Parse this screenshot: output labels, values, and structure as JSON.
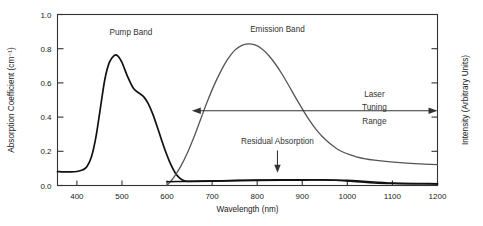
{
  "chart_data": {
    "type": "line",
    "title": "",
    "xlabel": "Wavelength (nm)",
    "ylabel": "Absorption Coefficient (cm⁻¹)",
    "y2label": "Intensity (Arbitrary Units)",
    "xlim": [
      357,
      1200
    ],
    "ylim": [
      0.0,
      1.0
    ],
    "grid": false,
    "legend_position": "inline-annotations",
    "xticks": [
      400,
      500,
      600,
      700,
      800,
      900,
      1000,
      1100,
      1200
    ],
    "xticklabels": [
      "400",
      "500",
      "600",
      "700",
      "800",
      "900",
      "1000",
      "1100",
      "1200"
    ],
    "yticks": [
      0.0,
      0.2,
      0.4,
      0.6,
      0.8,
      1.0
    ],
    "yticklabels": [
      "0.0",
      "0.2",
      "0.4",
      "0.6",
      "0.8",
      "1.0"
    ],
    "y2ticks": [
      0.2,
      0.4,
      0.6,
      0.8
    ],
    "y2ticklabels": [
      "",
      "",
      "",
      ""
    ],
    "series": [
      {
        "name": "Pump Band",
        "color": "#111111",
        "x": [
          357,
          370,
          385,
          400,
          412,
          422,
          432,
          442,
          452,
          462,
          472,
          482,
          490,
          500,
          512,
          525,
          538,
          548,
          558,
          568,
          578,
          588,
          598,
          608,
          618,
          628,
          638,
          648,
          660,
          700,
          800,
          900,
          1000,
          1100,
          1200
        ],
        "values": [
          0.082,
          0.08,
          0.08,
          0.082,
          0.09,
          0.11,
          0.165,
          0.28,
          0.45,
          0.62,
          0.72,
          0.758,
          0.76,
          0.72,
          0.64,
          0.57,
          0.54,
          0.52,
          0.48,
          0.42,
          0.345,
          0.265,
          0.19,
          0.125,
          0.075,
          0.043,
          0.028,
          0.024,
          0.024,
          0.026,
          0.03,
          0.032,
          0.03,
          0.014,
          0.01
        ]
      },
      {
        "name": "Emission Band",
        "color": "#555555",
        "x": [
          600,
          615,
          630,
          645,
          660,
          675,
          690,
          705,
          720,
          735,
          750,
          765,
          780,
          795,
          810,
          825,
          840,
          855,
          870,
          885,
          900,
          915,
          930,
          945,
          960,
          975,
          990,
          1005,
          1020,
          1040,
          1060,
          1080,
          1110,
          1150,
          1200
        ],
        "values": [
          0.0,
          0.048,
          0.11,
          0.19,
          0.285,
          0.39,
          0.495,
          0.59,
          0.672,
          0.74,
          0.79,
          0.818,
          0.828,
          0.822,
          0.8,
          0.762,
          0.712,
          0.652,
          0.585,
          0.515,
          0.448,
          0.385,
          0.33,
          0.285,
          0.248,
          0.218,
          0.196,
          0.18,
          0.168,
          0.156,
          0.148,
          0.142,
          0.135,
          0.128,
          0.122
        ]
      },
      {
        "name": "Residual Absorption",
        "color": "#111111",
        "x": [
          600,
          640,
          680,
          720,
          760,
          800,
          840,
          880,
          920,
          950,
          975,
          1000,
          1030,
          1060,
          1100,
          1150,
          1200
        ],
        "values": [
          0.022,
          0.024,
          0.026,
          0.028,
          0.03,
          0.032,
          0.033,
          0.034,
          0.034,
          0.033,
          0.03,
          0.026,
          0.02,
          0.015,
          0.012,
          0.01,
          0.009
        ]
      }
    ],
    "annotations": [
      {
        "name": "pump-band-label",
        "text": "Pump Band",
        "x": 520,
        "y": 0.88,
        "anchor": "middle"
      },
      {
        "name": "emission-band-label",
        "text": "Emission Band",
        "x": 845,
        "y": 0.895,
        "anchor": "middle"
      },
      {
        "name": "residual-absorption-label",
        "text": "Residual Absorption",
        "x": 845,
        "y": 0.24,
        "anchor": "middle"
      },
      {
        "name": "laser-tuning-range-line1",
        "text": "Laser",
        "x": 1060,
        "y": 0.52,
        "anchor": "middle"
      },
      {
        "name": "laser-tuning-range-line2",
        "text": "Tuning",
        "x": 1060,
        "y": 0.44,
        "anchor": "middle"
      },
      {
        "name": "laser-tuning-range-line3",
        "text": "Range",
        "x": 1060,
        "y": 0.36,
        "anchor": "middle"
      }
    ],
    "arrows": [
      {
        "name": "laser-tuning-range-arrow",
        "type": "double-horizontal",
        "x_start": 655,
        "x_end": 1200,
        "y": 0.437
      },
      {
        "name": "residual-absorption-arrow",
        "type": "down",
        "x": 845,
        "y_start": 0.205,
        "y_end": 0.075
      }
    ]
  }
}
